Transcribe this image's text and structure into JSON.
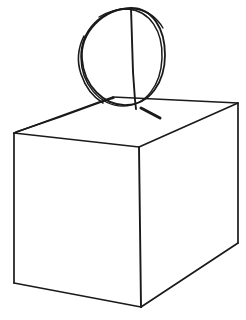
{
  "figure": {
    "medium": "ink line drawing",
    "background_color": "#ffffff",
    "stroke_color": "#1a1a1a",
    "canvas": {
      "width": 246,
      "height": 320
    }
  },
  "shapes": {
    "sphere": {
      "name": "ball",
      "center_x": 123,
      "center_y": 57,
      "radius_x": 42,
      "radius_y": 49,
      "overdraw_passes": 2,
      "outline_a": "M 131 8 C 152 8 165 28 165 55 C 165 82 150 104 127 105 C 104 106 84 86 82 59 C 80 32 103 9 131 8 Z",
      "outline_b": "M 128 9 C 150 11 163 31 162 58 C 161 85 146 106 123 106 C 100 106 81 84 81 57 C 81 30 102 9 128 9 Z",
      "overdraw_left": "M 84 36 C 78 48 77 62 81 74 C 85 86 93 97 103 103",
      "overdraw_top": "M 99 17 C 111 10 124 7 136 9 C 148 11 157 18 163 28"
    },
    "axis_line": {
      "name": "vertical-center-axis",
      "from": [
        131,
        8
      ],
      "to": [
        136,
        108
      ],
      "path": "M 131 8 L 132 40 L 133 72 L 135 100 L 136 109"
    },
    "contact_tick": {
      "name": "contact-shadow-tick",
      "path": "M 141 108 L 160 118",
      "stroke_width": 3
    },
    "box": {
      "name": "rectangular-box",
      "vertices": {
        "top_back": [
          113,
          97
        ],
        "top_left": [
          14,
          133
        ],
        "top_front": [
          139,
          147
        ],
        "top_right": [
          238,
          103
        ],
        "bot_left": [
          14,
          283
        ],
        "bot_front": [
          141,
          307
        ],
        "bot_right": [
          238,
          243
        ]
      },
      "edges": [
        {
          "name": "top-back-left",
          "from": "top_back",
          "to": "top_left",
          "visible": true
        },
        {
          "name": "top-left-front",
          "from": "top_left",
          "to": "top_front",
          "visible": true
        },
        {
          "name": "top-front-right",
          "from": "top_front",
          "to": "top_right",
          "visible": true
        },
        {
          "name": "top-right-back",
          "from": "top_right",
          "to": "top_back",
          "visible": true
        },
        {
          "name": "left-vertical",
          "from": "top_left",
          "to": "bot_left",
          "visible": true
        },
        {
          "name": "front-vertical",
          "from": "top_front",
          "to": "bot_front",
          "visible": true
        },
        {
          "name": "right-vertical",
          "from": "top_right",
          "to": "bot_right",
          "visible": true
        },
        {
          "name": "bottom-left",
          "from": "bot_left",
          "to": "bot_front",
          "visible": true
        },
        {
          "name": "bottom-right",
          "from": "bot_front",
          "to": "bot_right",
          "visible": true
        }
      ],
      "overdraw_top_left_edge": "M 16 132 L 60 117 L 104 101 L 114 98"
    }
  },
  "stroke_widths": {
    "thin": 1.4,
    "medium": 1.8,
    "thick": 3
  }
}
